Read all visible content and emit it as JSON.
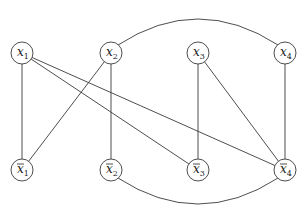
{
  "diagram": {
    "type": "graph",
    "node_radius": 11,
    "colors": {
      "stroke": "#3a3a3a",
      "fill": "#ffffff",
      "text": "#222222"
    },
    "nodes": [
      {
        "id": "x1",
        "var": "x",
        "sub": "1",
        "negated": false,
        "x": 22,
        "y": 53
      },
      {
        "id": "x2",
        "var": "x",
        "sub": "2",
        "negated": false,
        "x": 111,
        "y": 53
      },
      {
        "id": "x3",
        "var": "x",
        "sub": "3",
        "negated": false,
        "x": 198,
        "y": 53
      },
      {
        "id": "x4",
        "var": "x",
        "sub": "4",
        "negated": false,
        "x": 285,
        "y": 53
      },
      {
        "id": "nx1",
        "var": "x",
        "sub": "1",
        "negated": true,
        "x": 22,
        "y": 170
      },
      {
        "id": "nx2",
        "var": "x",
        "sub": "2",
        "negated": true,
        "x": 111,
        "y": 170
      },
      {
        "id": "nx3",
        "var": "x",
        "sub": "3",
        "negated": true,
        "x": 198,
        "y": 170
      },
      {
        "id": "nx4",
        "var": "x",
        "sub": "4",
        "negated": true,
        "x": 285,
        "y": 170
      }
    ],
    "edges": [
      {
        "from": "x1",
        "to": "nx1",
        "shape": "line"
      },
      {
        "from": "x1",
        "to": "nx3",
        "shape": "line"
      },
      {
        "from": "x1",
        "to": "nx4",
        "shape": "line"
      },
      {
        "from": "x2",
        "to": "nx1",
        "shape": "line"
      },
      {
        "from": "x2",
        "to": "nx2",
        "shape": "line"
      },
      {
        "from": "x2",
        "to": "x4",
        "shape": "arc-up"
      },
      {
        "from": "x3",
        "to": "nx3",
        "shape": "line"
      },
      {
        "from": "x3",
        "to": "nx4",
        "shape": "line"
      },
      {
        "from": "x4",
        "to": "nx4",
        "shape": "line"
      },
      {
        "from": "nx2",
        "to": "nx4",
        "shape": "arc-down"
      }
    ]
  }
}
